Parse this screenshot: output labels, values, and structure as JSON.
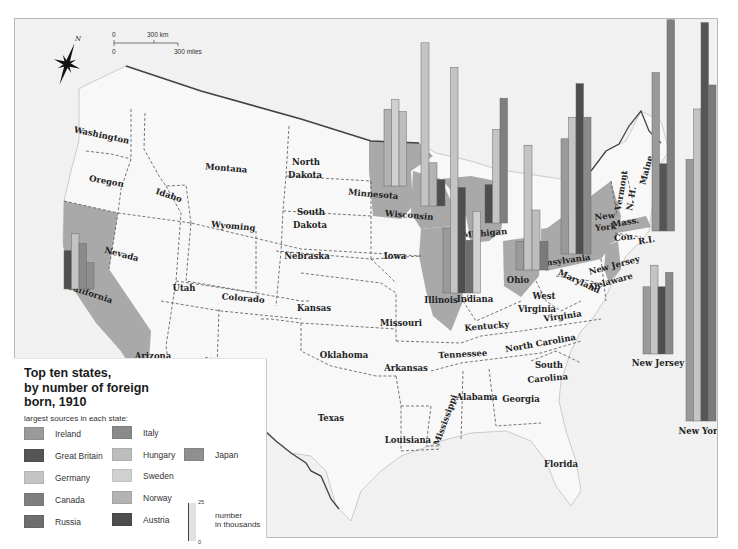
{
  "map": {
    "compass_label": "N",
    "scale": {
      "km_zero": "0",
      "km_label": "300 km",
      "mi_zero": "0",
      "mi_label": "300 miles"
    },
    "states": [
      {
        "name": "Washington",
        "x": 100,
        "y": 137,
        "rot": 12
      },
      {
        "name": "Oregon",
        "x": 105,
        "y": 183,
        "rot": 10
      },
      {
        "name": "California",
        "x": 88,
        "y": 295,
        "rot": 18
      },
      {
        "name": "Nevada",
        "x": 120,
        "y": 256,
        "rot": 15
      },
      {
        "name": "Idaho",
        "x": 167,
        "y": 197,
        "rot": 18
      },
      {
        "name": "Montana",
        "x": 225,
        "y": 170,
        "rot": 5
      },
      {
        "name": "Wyoming",
        "x": 232,
        "y": 228,
        "rot": 5
      },
      {
        "name": "Utah",
        "x": 183,
        "y": 290,
        "rot": 0
      },
      {
        "name": "Colorado",
        "x": 242,
        "y": 300,
        "rot": 5
      },
      {
        "name": "Arizona",
        "x": 152,
        "y": 358,
        "rot": 0
      },
      {
        "name": "New Mexico",
        "x": 232,
        "y": 365,
        "rot": 5
      },
      {
        "name": "North",
        "x": 305,
        "y": 164,
        "rot": 0
      },
      {
        "name": "Dakota",
        "x": 304,
        "y": 177,
        "rot": 0
      },
      {
        "name": "South",
        "x": 310,
        "y": 214,
        "rot": 0
      },
      {
        "name": "Dakota",
        "x": 309,
        "y": 227,
        "rot": 0
      },
      {
        "name": "Nebraska",
        "x": 306,
        "y": 258,
        "rot": 0
      },
      {
        "name": "Kansas",
        "x": 313,
        "y": 310,
        "rot": 0
      },
      {
        "name": "Oklahoma",
        "x": 343,
        "y": 357,
        "rot": 0
      },
      {
        "name": "Texas",
        "x": 330,
        "y": 420,
        "rot": 0
      },
      {
        "name": "Iowa",
        "x": 394,
        "y": 258,
        "rot": 0
      },
      {
        "name": "Missouri",
        "x": 400,
        "y": 325,
        "rot": 0
      },
      {
        "name": "Arkansas",
        "x": 405,
        "y": 370,
        "rot": 0
      },
      {
        "name": "Louisiana",
        "x": 407,
        "y": 442,
        "rot": 0
      },
      {
        "name": "Minnesota",
        "x": 372,
        "y": 196,
        "rot": 5
      },
      {
        "name": "Wisconsin",
        "x": 408,
        "y": 217,
        "rot": 5
      },
      {
        "name": "Illinois",
        "x": 440,
        "y": 302,
        "rot": 0
      },
      {
        "name": "Michigan",
        "x": 484,
        "y": 235,
        "rot": -5
      },
      {
        "name": "Indiana",
        "x": 474,
        "y": 301,
        "rot": 0
      },
      {
        "name": "Ohio",
        "x": 517,
        "y": 282,
        "rot": 0
      },
      {
        "name": "Kentucky",
        "x": 486,
        "y": 328,
        "rot": -5
      },
      {
        "name": "Tennessee",
        "x": 462,
        "y": 356,
        "rot": -3
      },
      {
        "name": "Mississippi",
        "x": 447,
        "y": 420,
        "rot": -70
      },
      {
        "name": "Alabama",
        "x": 476,
        "y": 399,
        "rot": 0
      },
      {
        "name": "Georgia",
        "x": 520,
        "y": 401,
        "rot": 0
      },
      {
        "name": "Florida",
        "x": 560,
        "y": 466,
        "rot": 0
      },
      {
        "name": "South",
        "x": 548,
        "y": 367,
        "rot": 0
      },
      {
        "name": "Carolina",
        "x": 547,
        "y": 380,
        "rot": -5
      },
      {
        "name": "North Carolina",
        "x": 540,
        "y": 345,
        "rot": -10
      },
      {
        "name": "West",
        "x": 543,
        "y": 298,
        "rot": 0
      },
      {
        "name": "Virginia",
        "x": 536,
        "y": 311,
        "rot": 0
      },
      {
        "name": "Virginia",
        "x": 562,
        "y": 318,
        "rot": -8
      },
      {
        "name": "Pennsylvania",
        "x": 559,
        "y": 263,
        "rot": -8
      },
      {
        "name": "Maryland",
        "x": 577,
        "y": 283,
        "rot": 25
      },
      {
        "name": "Delaware",
        "x": 611,
        "y": 283,
        "rot": -15
      },
      {
        "name": "New Jersey",
        "x": 614,
        "y": 267,
        "rot": -15
      },
      {
        "name": "New",
        "x": 604,
        "y": 218,
        "rot": -5
      },
      {
        "name": "York",
        "x": 605,
        "y": 229,
        "rot": -5
      },
      {
        "name": "Mass.",
        "x": 625,
        "y": 224,
        "rot": -10
      },
      {
        "name": "Con.",
        "x": 624,
        "y": 239,
        "rot": -5
      },
      {
        "name": "R.I.",
        "x": 646,
        "y": 242,
        "rot": -10
      },
      {
        "name": "Vermont",
        "x": 623,
        "y": 190,
        "rot": -80
      },
      {
        "name": "N. H.",
        "x": 633,
        "y": 198,
        "rot": -80
      },
      {
        "name": "Maine",
        "x": 648,
        "y": 170,
        "rot": -75
      }
    ]
  },
  "legend": {
    "title_line1": "Top ten states,",
    "title_line2": "by number of foreign",
    "title_line3": "born, 1910",
    "subtitle": "largest sources in each state:",
    "items": [
      {
        "label": "Ireland",
        "color": "#9a9a9a"
      },
      {
        "label": "Great Britain",
        "color": "#555555"
      },
      {
        "label": "Germany",
        "color": "#c4c4c4"
      },
      {
        "label": "Canada",
        "color": "#7f7f7f"
      },
      {
        "label": "Russia",
        "color": "#6e6e6e"
      },
      {
        "label": "Italy",
        "color": "#8a8a8a"
      },
      {
        "label": "Hungary",
        "color": "#bdbdbd"
      },
      {
        "label": "Sweden",
        "color": "#d0d0d0"
      },
      {
        "label": "Norway",
        "color": "#b3b3b3"
      },
      {
        "label": "Austria",
        "color": "#4e4e4e"
      },
      {
        "label": "Japan",
        "color": "#8f8f8f"
      }
    ],
    "scale_top": "25",
    "scale_bottom": "0",
    "scale_label_line1": "number",
    "scale_label_line2": "in thousands"
  },
  "chart_data": {
    "type": "bar",
    "title": "Top ten states, by number of foreign born, 1910",
    "subtitle": "largest sources in each state",
    "unit": "thousands",
    "scale_reference": {
      "min": 0,
      "max": 25
    },
    "groups": [
      {
        "state": "California",
        "bars": [
          {
            "source": "Austria",
            "value": 16,
            "color": "#4e4e4e"
          },
          {
            "source": "Germany",
            "value": 23,
            "color": "#c4c4c4"
          },
          {
            "source": "Italy",
            "value": 19,
            "color": "#8a8a8a"
          },
          {
            "source": "Japan",
            "value": 11,
            "color": "#8f8f8f"
          }
        ]
      },
      {
        "state": "Minnesota",
        "bars": [
          {
            "source": "Norway",
            "value": 32,
            "color": "#b3b3b3"
          },
          {
            "source": "Sweden",
            "value": 36,
            "color": "#d0d0d0"
          },
          {
            "source": "Germany",
            "value": 31,
            "color": "#bdbdbd"
          }
        ]
      },
      {
        "state": "Wisconsin",
        "bars": [
          {
            "source": "Germany",
            "value": 68,
            "color": "#c4c4c4"
          },
          {
            "source": "Norway",
            "value": 18,
            "color": "#b3b3b3"
          },
          {
            "source": "Austria",
            "value": 11,
            "color": "#4e4e4e"
          }
        ]
      },
      {
        "state": "Illinois",
        "bars": [
          {
            "source": "Ireland",
            "value": 27,
            "color": "#9a9a9a"
          },
          {
            "source": "Germany",
            "value": 94,
            "color": "#c4c4c4"
          },
          {
            "source": "Austria",
            "value": 44,
            "color": "#4e4e4e"
          },
          {
            "source": "Russia",
            "value": 22,
            "color": "#6e6e6e"
          },
          {
            "source": "Sweden",
            "value": 34,
            "color": "#d0d0d0"
          }
        ]
      },
      {
        "state": "Michigan",
        "bars": [
          {
            "source": "Austria",
            "value": 16,
            "color": "#4e4e4e"
          },
          {
            "source": "Germany",
            "value": 39,
            "color": "#c4c4c4"
          },
          {
            "source": "Canada",
            "value": 52,
            "color": "#7f7f7f"
          }
        ]
      },
      {
        "state": "Ohio",
        "bars": [
          {
            "source": "Hungary",
            "value": 12,
            "color": "#9a9a9a"
          },
          {
            "source": "Germany",
            "value": 52,
            "color": "#c4c4c4"
          },
          {
            "source": "Hungary",
            "value": 25,
            "color": "#bdbdbd"
          },
          {
            "source": "Austria",
            "value": 12,
            "color": "#7a7a7a"
          }
        ]
      },
      {
        "state": "Pennsylvania",
        "bars": [
          {
            "source": "Ireland",
            "value": 48,
            "color": "#9a9a9a"
          },
          {
            "source": "Germany",
            "value": 57,
            "color": "#c4c4c4"
          },
          {
            "source": "Austria",
            "value": 71,
            "color": "#4e4e4e"
          },
          {
            "source": "Italy",
            "value": 57,
            "color": "#8a8a8a"
          }
        ]
      },
      {
        "state": "Massachusetts",
        "bars": [
          {
            "source": "Ireland",
            "value": 66,
            "color": "#9a9a9a"
          },
          {
            "source": "Great Britain",
            "value": 28,
            "color": "#555555"
          },
          {
            "source": "Canada",
            "value": 88,
            "color": "#7f7f7f"
          }
        ]
      },
      {
        "state": "New Jersey",
        "bars": [
          {
            "source": "Ireland",
            "value": 28,
            "color": "#9a9a9a"
          },
          {
            "source": "Germany",
            "value": 37,
            "color": "#c4c4c4"
          },
          {
            "source": "Austria",
            "value": 28,
            "color": "#4e4e4e"
          },
          {
            "source": "Italy",
            "value": 34,
            "color": "#8a8a8a"
          }
        ]
      },
      {
        "state": "New York",
        "bars": [
          {
            "source": "Ireland",
            "value": 109,
            "color": "#9a9a9a"
          },
          {
            "source": "Germany",
            "value": 130,
            "color": "#c4c4c4"
          },
          {
            "source": "Russia",
            "value": 166,
            "color": "#555555"
          },
          {
            "source": "Italy",
            "value": 140,
            "color": "#7a7a7a"
          }
        ]
      }
    ]
  },
  "bar_layout": [
    {
      "x": 63,
      "base": 288,
      "w": 7.5,
      "label": "",
      "lx": 0,
      "ly": 0
    },
    {
      "x": 383,
      "base": 185,
      "w": 7.5,
      "label": "",
      "lx": 0,
      "ly": 0
    },
    {
      "x": 420,
      "base": 205,
      "w": 8,
      "label": "",
      "lx": 0,
      "ly": 0
    },
    {
      "x": 442,
      "base": 292,
      "w": 7.5,
      "label": "",
      "lx": 0,
      "ly": 0
    },
    {
      "x": 484,
      "base": 222,
      "w": 7.5,
      "label": "",
      "lx": 0,
      "ly": 0
    },
    {
      "x": 515,
      "base": 269,
      "w": 8,
      "label": "",
      "lx": 0,
      "ly": 0
    },
    {
      "x": 560,
      "base": 253,
      "w": 7.5,
      "label": "",
      "lx": 0,
      "ly": 0
    },
    {
      "x": 651,
      "base": 230,
      "w": 7.5,
      "label": "",
      "lx": 0,
      "ly": 0
    },
    {
      "x": 642,
      "base": 353,
      "w": 7.5,
      "label": "New Jersey",
      "lx": 657,
      "ly": 365
    },
    {
      "x": 685,
      "base": 420,
      "w": 7.5,
      "label": "New York",
      "lx": 700,
      "ly": 433
    }
  ]
}
